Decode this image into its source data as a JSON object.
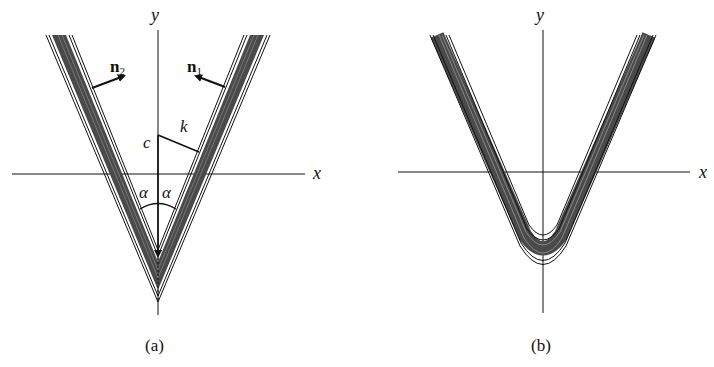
{
  "figure": {
    "panels": [
      {
        "id": "a",
        "caption": "(a)",
        "axes": {
          "x_label": "x",
          "y_label": "y"
        },
        "labels": {
          "n1_base": "n",
          "n1_sub": "1",
          "n2_base": "n",
          "n2_sub": "2",
          "c": "c",
          "k": "k",
          "alpha_left": "α",
          "alpha_right": "α"
        },
        "description": "Sharp V-shaped wedge of contour bands with normals n1, n2; half-angle alpha; distance k from point c on the y-axis to the right band"
      },
      {
        "id": "b",
        "caption": "(b)",
        "axes": {
          "x_label": "x",
          "y_label": "y"
        },
        "description": "V-shaped contour bands with a rounded (smoothed) vertex below the x-axis"
      }
    ],
    "colors": {
      "ink": "#111111",
      "band_fill": "#555555",
      "background": "#ffffff"
    }
  }
}
